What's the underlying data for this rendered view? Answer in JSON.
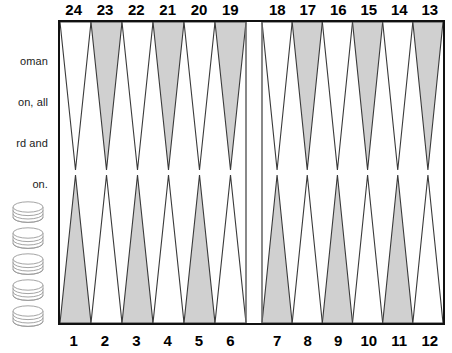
{
  "caption": {
    "lines": [
      "oman",
      "on, all",
      "rd and",
      "on."
    ]
  },
  "board": {
    "title": "backgammon-board",
    "colors": {
      "point_dark": "#d0d0d0",
      "point_light": "#ffffff",
      "outline": "#3a3a3a",
      "border": "#111111",
      "bar": "#6b6b6b",
      "checker_outline": "#9a9a9a"
    },
    "top_points": [
      {
        "number": "24",
        "fill": "light"
      },
      {
        "number": "23",
        "fill": "dark"
      },
      {
        "number": "22",
        "fill": "light"
      },
      {
        "number": "21",
        "fill": "dark"
      },
      {
        "number": "20",
        "fill": "light"
      },
      {
        "number": "19",
        "fill": "dark"
      },
      {
        "number": "18",
        "fill": "light"
      },
      {
        "number": "17",
        "fill": "dark"
      },
      {
        "number": "16",
        "fill": "light"
      },
      {
        "number": "15",
        "fill": "dark"
      },
      {
        "number": "14",
        "fill": "light"
      },
      {
        "number": "13",
        "fill": "dark"
      }
    ],
    "bottom_points": [
      {
        "number": "1",
        "fill": "dark"
      },
      {
        "number": "2",
        "fill": "light"
      },
      {
        "number": "3",
        "fill": "dark"
      },
      {
        "number": "4",
        "fill": "light"
      },
      {
        "number": "5",
        "fill": "dark"
      },
      {
        "number": "6",
        "fill": "light"
      },
      {
        "number": "7",
        "fill": "dark"
      },
      {
        "number": "8",
        "fill": "light"
      },
      {
        "number": "9",
        "fill": "dark"
      },
      {
        "number": "10",
        "fill": "light"
      },
      {
        "number": "11",
        "fill": "dark"
      },
      {
        "number": "12",
        "fill": "light"
      }
    ],
    "bar": {
      "label": "bar",
      "visible": true
    }
  },
  "checker_tray": {
    "label": "checker-stacks",
    "stack_count": 5,
    "discs_per_stack": 4
  }
}
